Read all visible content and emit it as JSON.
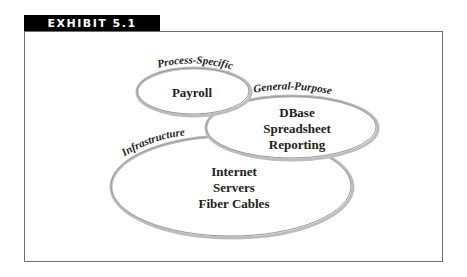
{
  "exhibit": {
    "label": "EXHIBIT 5.1"
  },
  "diagram": {
    "ellipses": [
      {
        "category": "Process-Specific",
        "items": [
          "Payroll"
        ]
      },
      {
        "category": "General-Purpose",
        "items": [
          "DBase",
          "Spreadsheet",
          "Reporting"
        ]
      },
      {
        "category": "Infrastructure",
        "items": [
          "Internet",
          "Servers",
          "Fiber Cables"
        ]
      }
    ]
  }
}
